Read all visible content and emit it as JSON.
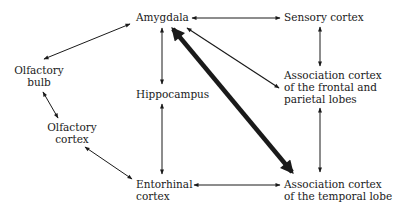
{
  "diagram": {
    "nodes": {
      "amygdala": {
        "lines": [
          "Amygdala"
        ]
      },
      "sensory_cortex": {
        "lines": [
          "Sensory cortex"
        ]
      },
      "olfactory_bulb": {
        "lines": [
          "Olfactory",
          "bulb"
        ]
      },
      "hippocampus": {
        "lines": [
          "Hippocampus"
        ]
      },
      "assoc_frontal_parietal": {
        "lines": [
          "Association cortex",
          "of the frontal and",
          "parietal lobes"
        ]
      },
      "olfactory_cortex": {
        "lines": [
          "Olfactory",
          "cortex"
        ]
      },
      "entorhinal_cortex": {
        "lines": [
          "Entorhinal",
          "cortex"
        ]
      },
      "assoc_temporal": {
        "lines": [
          "Association cortex",
          "of the temporal lobe"
        ]
      }
    },
    "edges": [
      {
        "from": "amygdala",
        "to": "olfactory_bulb",
        "direction": "bidirectional",
        "weight": "thin"
      },
      {
        "from": "amygdala",
        "to": "sensory_cortex",
        "direction": "bidirectional",
        "weight": "thin"
      },
      {
        "from": "amygdala",
        "to": "hippocampus",
        "direction": "bidirectional",
        "weight": "thin"
      },
      {
        "from": "amygdala",
        "to": "assoc_frontal_parietal",
        "direction": "bidirectional",
        "weight": "thin"
      },
      {
        "from": "amygdala",
        "to": "assoc_temporal",
        "direction": "bidirectional",
        "weight": "thick"
      },
      {
        "from": "sensory_cortex",
        "to": "assoc_frontal_parietal",
        "direction": "bidirectional",
        "weight": "thin"
      },
      {
        "from": "assoc_frontal_parietal",
        "to": "assoc_temporal",
        "direction": "bidirectional",
        "weight": "thin"
      },
      {
        "from": "olfactory_bulb",
        "to": "olfactory_cortex",
        "direction": "bidirectional",
        "weight": "thin"
      },
      {
        "from": "olfactory_cortex",
        "to": "entorhinal_cortex",
        "direction": "bidirectional",
        "weight": "thin"
      },
      {
        "from": "hippocampus",
        "to": "entorhinal_cortex",
        "direction": "bidirectional",
        "weight": "thin"
      },
      {
        "from": "entorhinal_cortex",
        "to": "assoc_temporal",
        "direction": "bidirectional",
        "weight": "thin"
      }
    ],
    "colors": {
      "line": "#1a1a1a",
      "text": "#1a1a1a",
      "background": "#ffffff"
    }
  }
}
